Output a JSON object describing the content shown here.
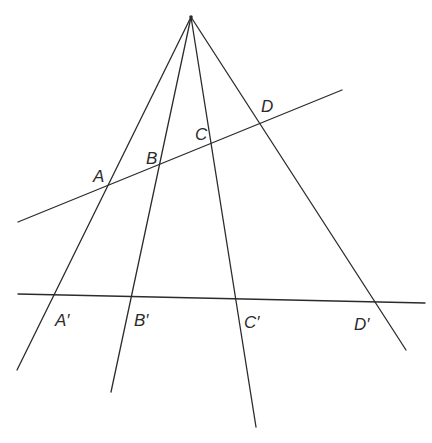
{
  "diagram": {
    "type": "projective-geometry-perspectivity",
    "apex": {
      "x": 191,
      "y": 17
    },
    "rays": [
      {
        "name": "ray-a",
        "end": {
          "x": 17,
          "y": 370
        }
      },
      {
        "name": "ray-b",
        "end": {
          "x": 111,
          "y": 392
        }
      },
      {
        "name": "ray-c",
        "end": {
          "x": 256,
          "y": 427
        }
      },
      {
        "name": "ray-d",
        "end": {
          "x": 406,
          "y": 350
        }
      }
    ],
    "transversals": [
      {
        "name": "upper-line",
        "from": {
          "x": 18,
          "y": 222
        },
        "to": {
          "x": 342,
          "y": 90
        }
      },
      {
        "name": "lower-line",
        "from": {
          "x": 18,
          "y": 294
        },
        "to": {
          "x": 425,
          "y": 303
        }
      }
    ],
    "labels": {
      "A": "A",
      "B": "B",
      "C": "C",
      "D": "D",
      "A_prime": "A′",
      "B_prime": "B′",
      "C_prime": "C′",
      "D_prime": "D′"
    },
    "stroke_color": "#2b2b2b",
    "background_color": "#ffffff"
  }
}
